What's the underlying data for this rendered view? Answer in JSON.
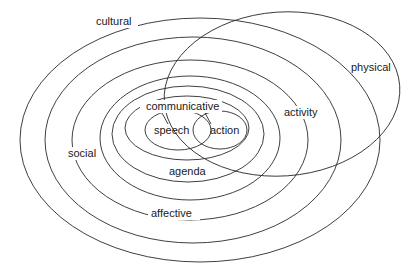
{
  "diagram": {
    "type": "nested-ellipse-context-diagram",
    "labels": {
      "cultural": "cultural",
      "physical": "physical",
      "activity": "activity",
      "social": "social",
      "affective": "affective",
      "agenda": "agenda",
      "communicative": "communicative",
      "speech": "speech",
      "action": "action"
    },
    "stroke_color": "#2a2a2a",
    "background_color": "#ffffff"
  }
}
